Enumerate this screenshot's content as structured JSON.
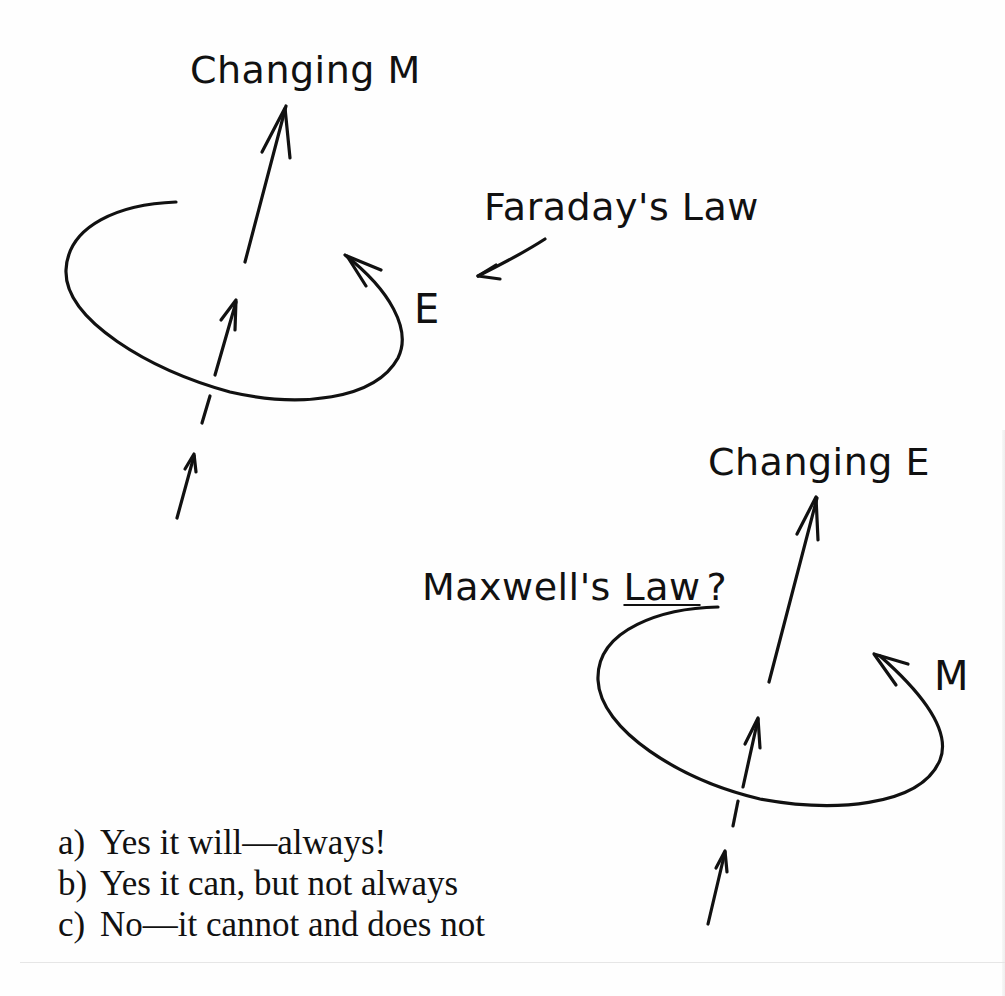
{
  "diagram": {
    "faraday": {
      "source_label": "Changing M",
      "field_label": "E",
      "law_label": "Faraday's Law"
    },
    "maxwell": {
      "source_label": "Changing E",
      "field_label": "M",
      "law_label_main": "Maxwell's ",
      "law_label_underlined": "Law",
      "law_label_suffix": "?"
    },
    "stroke_color": "#111111",
    "background_color": "#fefefe"
  },
  "question": {
    "options": [
      {
        "key": "a)",
        "text": "Yes it will—always!"
      },
      {
        "key": "b)",
        "text": "Yes it can, but not always"
      },
      {
        "key": "c)",
        "text": "No—it cannot and does not"
      }
    ]
  }
}
